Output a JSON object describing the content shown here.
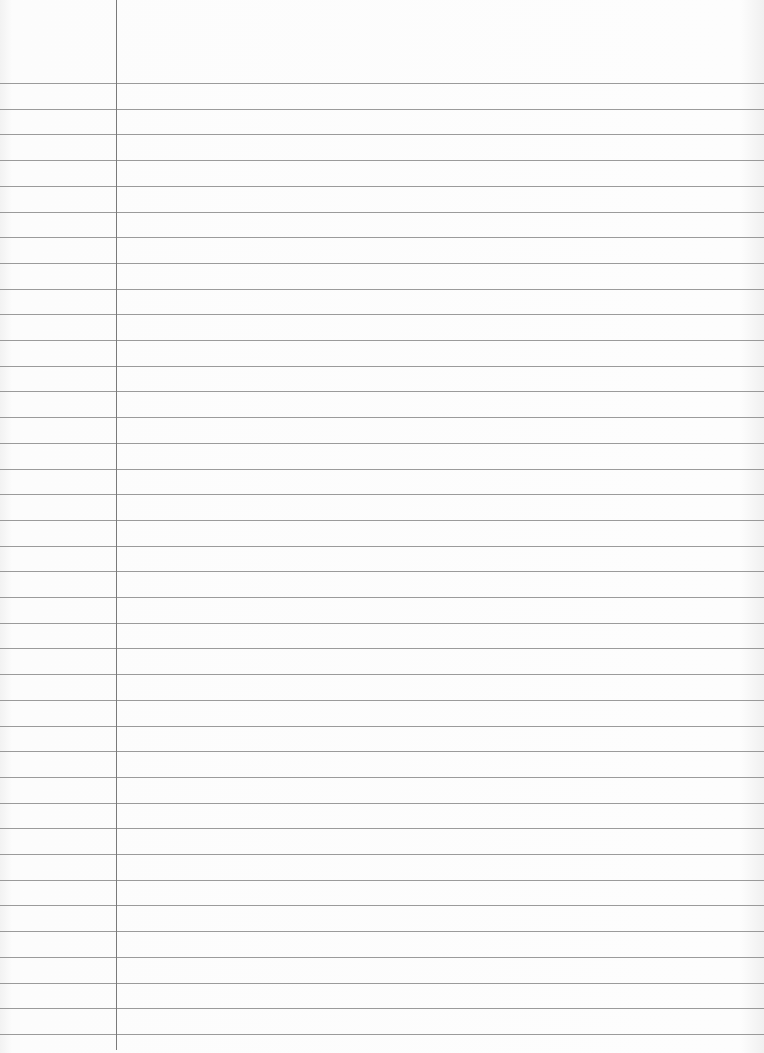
{
  "page": {
    "type": "lined-paper",
    "ruled_line_count": 38,
    "has_margin_line": true,
    "colors": {
      "paper": "#fbfbfb",
      "rule": "#8a8a8a",
      "margin": "#7a7a7a"
    }
  }
}
